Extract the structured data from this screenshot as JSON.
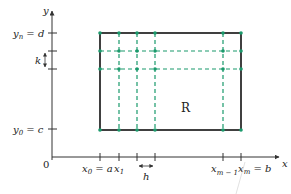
{
  "diagram": {
    "region_label": "R",
    "origin_label": "0",
    "axes": {
      "x_label": "x",
      "y_label": "y"
    },
    "x_ticks": [
      {
        "base": "x",
        "sub": "0",
        "suffix": " = a"
      },
      {
        "base": "x",
        "sub": "1",
        "suffix": ""
      },
      {
        "base": "x",
        "sub": "m − 1",
        "suffix": ""
      },
      {
        "base": "x",
        "sub": "m",
        "suffix": " = b"
      }
    ],
    "y_ticks": [
      {
        "base": "y",
        "sub": "n",
        "suffix": " = d"
      },
      {
        "base": "y",
        "sub": "0",
        "suffix": " = c"
      }
    ],
    "step_labels": {
      "horizontal": "h",
      "vertical": "k"
    },
    "colors": {
      "grid_dashed": "#1a9a6c",
      "grid_points": "#1a9a6c",
      "boundary": "#111111",
      "axes": "#333333"
    }
  }
}
